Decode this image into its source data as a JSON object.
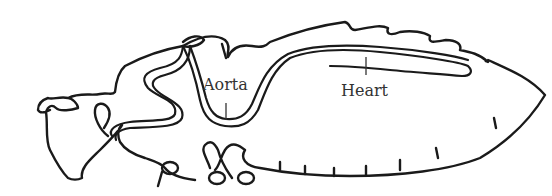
{
  "figure": {
    "labels": [
      {
        "id": "aorta",
        "text": "Aorta"
      },
      {
        "id": "heart",
        "text": "Heart"
      }
    ],
    "colors": {
      "line": "#1a1a1a",
      "label_text": "#333333",
      "background": "#ffffff"
    }
  }
}
